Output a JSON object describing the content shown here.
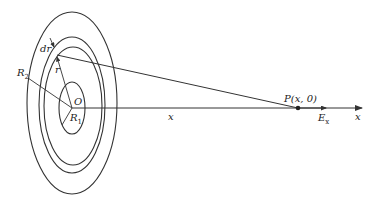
{
  "diagram": {
    "type": "charged-disk-annulus-field-on-axis",
    "colors": {
      "stroke": "#333333",
      "background": "#ffffff"
    },
    "labels": {
      "dr": "dr",
      "r": "r",
      "R2": "R",
      "R2_sub": "2",
      "O": "O",
      "R1": "R",
      "R1_sub": "1",
      "x_mid": "x",
      "P": "P",
      "P_coords": "(x, 0)",
      "Ex": "E",
      "Ex_sub": "x",
      "x_axis": "x"
    },
    "elements": [
      {
        "name": "outer-ellipse",
        "label": "R2 boundary"
      },
      {
        "name": "ring-outer",
        "label": "r + dr"
      },
      {
        "name": "ring-inner",
        "label": "r"
      },
      {
        "name": "inner-ellipse",
        "label": "R1 boundary"
      },
      {
        "name": "x-axis",
        "label": "x"
      },
      {
        "name": "point-P",
        "label": "P(x, 0)"
      },
      {
        "name": "field-arrow",
        "label": "Ex"
      }
    ]
  }
}
